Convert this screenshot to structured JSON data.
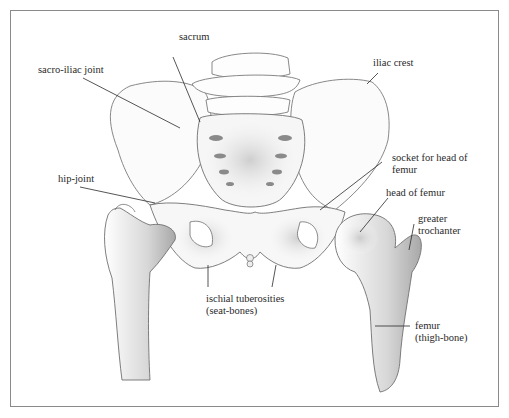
{
  "diagram": {
    "labels": {
      "sacrum": "sacrum",
      "sacro_iliac_joint": "sacro-iliac joint",
      "iliac_crest": "iliac crest",
      "socket_line1": "socket for head of",
      "socket_line2": "femur",
      "hip_joint": "hip-joint",
      "head_of_femur": "head of femur",
      "greater_trochanter_line1": "greater",
      "greater_trochanter_line2": "trochanter",
      "ischial_line1": "ischial tuberosities",
      "ischial_line2": "(seat-bones)",
      "femur_line1": "femur",
      "femur_line2": "(thigh-bone)"
    },
    "colors": {
      "line": "#2a2a2a",
      "bone_outline": "#6b6b6b",
      "shade": "#9a9a9a",
      "frame": "#8a8a8a"
    }
  }
}
